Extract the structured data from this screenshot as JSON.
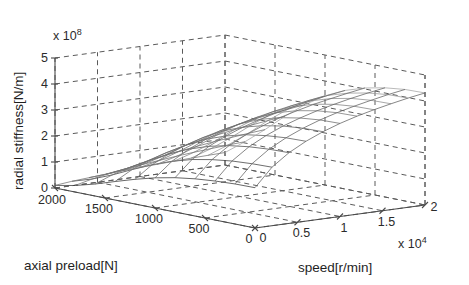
{
  "figure": {
    "kind": "3d-mesh-surface-plot",
    "background_color": "#ffffff",
    "mesh_color": "#4d4d4d",
    "grid_color": "#5a5a5a",
    "axis_color": "#4a4a4a"
  },
  "axes": {
    "x": {
      "label": "axial preload[N]",
      "ticks": [
        "2000",
        "1500",
        "1000",
        "500",
        "0"
      ],
      "values": [
        2000,
        1500,
        1000,
        500,
        0
      ],
      "range": [
        0,
        2000
      ],
      "units": "N",
      "exponent_label": ""
    },
    "y": {
      "label": "speed[r/min]",
      "ticks": [
        "0",
        "0.5",
        "1",
        "1.5",
        "2"
      ],
      "values": [
        0,
        0.5,
        1,
        1.5,
        2
      ],
      "range": [
        0,
        2
      ],
      "units": "r/min",
      "exponent_label": "x 10",
      "exponent_power": "4"
    },
    "z": {
      "label": "radial stiffness[N/m]",
      "ticks": [
        "0",
        "1",
        "2",
        "3",
        "4",
        "5"
      ],
      "values": [
        0,
        1,
        2,
        3,
        4,
        5
      ],
      "range": [
        0,
        5
      ],
      "units": "N/m",
      "exponent_label": "x 10",
      "exponent_power": "8"
    }
  },
  "chart_data": {
    "type": "surface",
    "title": "",
    "xlabel": "axial preload[N]",
    "ylabel": "speed[r/min]",
    "zlabel": "radial stiffness[N/m]",
    "xlim": [
      0,
      2000
    ],
    "ylim": [
      0,
      20000
    ],
    "zlim": [
      0,
      500000000
    ],
    "z_scale": "1e8",
    "y_scale": "1e4",
    "grid": true,
    "legend": "none",
    "x": [
      0,
      200,
      400,
      600,
      800,
      1000,
      1200,
      1400,
      1600,
      1800,
      2000
    ],
    "y": [
      0,
      2000,
      4000,
      6000,
      8000,
      10000,
      12000,
      14000,
      16000,
      18000,
      20000
    ],
    "z_units": "1e8 N/m",
    "z": [
      [
        1.55,
        1.54,
        1.5,
        1.43,
        1.32,
        1.16,
        0.95,
        0.71,
        0.46,
        0.25,
        0.1
      ],
      [
        2.25,
        2.23,
        2.18,
        2.08,
        1.93,
        1.71,
        1.42,
        1.08,
        0.72,
        0.41,
        0.17
      ],
      [
        2.72,
        2.7,
        2.64,
        2.53,
        2.35,
        2.09,
        1.75,
        1.34,
        0.91,
        0.53,
        0.22
      ],
      [
        3.07,
        3.05,
        2.98,
        2.86,
        2.66,
        2.38,
        2.0,
        1.55,
        1.06,
        0.63,
        0.27
      ],
      [
        3.35,
        3.33,
        3.26,
        3.12,
        2.91,
        2.61,
        2.2,
        1.71,
        1.18,
        0.71,
        0.31
      ],
      [
        3.58,
        3.56,
        3.48,
        3.34,
        3.12,
        2.8,
        2.37,
        1.85,
        1.29,
        0.78,
        0.35
      ],
      [
        3.77,
        3.75,
        3.67,
        3.52,
        3.29,
        2.96,
        2.51,
        1.97,
        1.38,
        0.85,
        0.38
      ],
      [
        3.93,
        3.91,
        3.83,
        3.68,
        3.44,
        3.1,
        2.64,
        2.08,
        1.47,
        0.91,
        0.41
      ],
      [
        4.07,
        4.05,
        3.97,
        3.81,
        3.57,
        3.22,
        2.75,
        2.17,
        1.54,
        0.96,
        0.44
      ],
      [
        4.2,
        4.18,
        4.09,
        3.93,
        3.69,
        3.33,
        2.85,
        2.26,
        1.61,
        1.01,
        0.46
      ],
      [
        4.31,
        4.29,
        4.2,
        4.04,
        3.79,
        3.43,
        2.94,
        2.34,
        1.67,
        1.05,
        0.48
      ]
    ]
  }
}
